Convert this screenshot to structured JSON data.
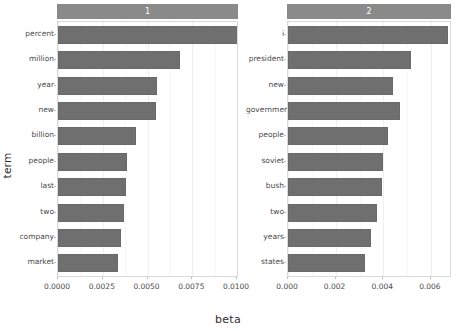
{
  "chart_data": {
    "type": "bar",
    "orientation": "horizontal",
    "title": "",
    "xlabel": "beta",
    "ylabel": "term",
    "grid": true,
    "legend": "none",
    "facets": [
      {
        "strip_label": "1",
        "xlim": [
          0.0,
          0.01
        ],
        "xticks": [
          0.0,
          0.0025,
          0.005,
          0.0075,
          0.01
        ],
        "xticklabels": [
          "0.0000",
          "0.0025",
          "0.0050",
          "0.0075",
          "0.0100"
        ],
        "categories": [
          "percent",
          "million",
          "year",
          "new",
          "billion",
          "people",
          "last",
          "two",
          "company",
          "market"
        ],
        "values": [
          0.0103,
          0.0068,
          0.00552,
          0.00548,
          0.00437,
          0.00385,
          0.00378,
          0.00368,
          0.00353,
          0.00333
        ]
      },
      {
        "strip_label": "2",
        "xlim": [
          0.0,
          0.0068
        ],
        "xticks": [
          0.0,
          0.002,
          0.004,
          0.006
        ],
        "xticklabels": [
          "0.000",
          "0.002",
          "0.004",
          "0.006"
        ],
        "categories": [
          "i",
          "president",
          "new",
          "government",
          "people",
          "soviet",
          "bush",
          "two",
          "years",
          "states"
        ],
        "values": [
          0.00672,
          0.00516,
          0.0044,
          0.00472,
          0.0042,
          0.004,
          0.00393,
          0.00373,
          0.00347,
          0.00325
        ]
      }
    ]
  },
  "axis": {
    "xlabel": "beta",
    "ylabel": "term"
  },
  "colors": {
    "bar": "#6f6f6f",
    "strip": "#8a8a8a",
    "panel_background": "#ffffff",
    "grid": "#efefef",
    "text": "#3a3a3a"
  }
}
